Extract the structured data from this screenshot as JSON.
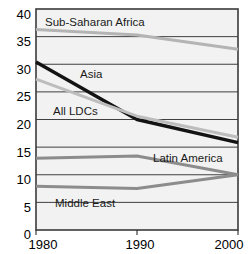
{
  "chart_data": {
    "type": "line",
    "title": "",
    "subtitle": "",
    "xlabel": "",
    "ylabel": "",
    "x": [
      1980,
      1990,
      2000
    ],
    "xtick_labels": [
      "1980",
      "1990",
      "2000"
    ],
    "ytick_labels": [
      "0",
      "5",
      "10",
      "15",
      "20",
      "25",
      "30",
      "35",
      "40"
    ],
    "ytick_values": [
      0,
      5,
      10,
      15,
      20,
      25,
      30,
      35,
      40
    ],
    "ylim": [
      0,
      40
    ],
    "xlim": [
      1980,
      2000
    ],
    "grid": true,
    "legend": "inline-labels",
    "series": [
      {
        "name": "Sub-Saharan Africa",
        "values": [
          36.3,
          35.3,
          32.7
        ],
        "color": "#b4b4b4",
        "width": 3.0,
        "label_x": 45,
        "label_y": 26
      },
      {
        "name": "Asia",
        "values": [
          30.4,
          20.0,
          15.8
        ],
        "color": "#131313",
        "width": 3.4,
        "label_x": 80,
        "label_y": 78
      },
      {
        "name": "All LDCs",
        "values": [
          27.3,
          20.6,
          16.8
        ],
        "color": "#bdbdbd",
        "width": 3.0,
        "label_x": 53,
        "label_y": 115
      },
      {
        "name": "Latin America",
        "values": [
          13.0,
          13.4,
          10.0
        ],
        "color": "#8c8c8c",
        "width": 3.0,
        "label_x": 153,
        "label_y": 162
      },
      {
        "name": "Middle East",
        "values": [
          7.9,
          7.5,
          10.0
        ],
        "color": "#8c8c8c",
        "width": 3.0,
        "label_x": 55,
        "label_y": 207
      }
    ]
  },
  "axes": {
    "y_labels": [
      {
        "text": "40",
        "y": 14
      },
      {
        "text": "35",
        "y": 41
      },
      {
        "text": "30",
        "y": 69
      },
      {
        "text": "25",
        "y": 96
      },
      {
        "text": "20",
        "y": 124
      },
      {
        "text": "15",
        "y": 152
      },
      {
        "text": "10",
        "y": 179
      },
      {
        "text": "5",
        "y": 207
      },
      {
        "text": "0",
        "y": 234
      }
    ],
    "x_labels": [
      {
        "text": "1980",
        "x": 43
      },
      {
        "text": "1990",
        "x": 140
      },
      {
        "text": "2000",
        "x": 229
      }
    ]
  }
}
